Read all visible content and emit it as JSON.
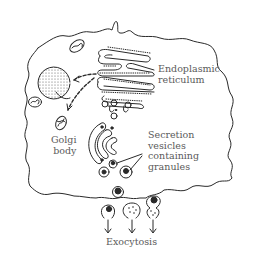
{
  "diagram": {
    "type": "cell secretion pathway illustration",
    "colors": {
      "ink": "#2a2a2a",
      "label": "#5a5a5a",
      "background": "#ffffff"
    },
    "labels": {
      "er_line1": "Endoplasmic",
      "er_line2": "reticulum",
      "golgi_line1": "Golgi",
      "golgi_line2": "body",
      "vesicles_line1": "Secretion",
      "vesicles_line2": "vesicles",
      "vesicles_line3": "containing",
      "vesicles_line4": "granules",
      "exocytosis": "Exocytosis"
    },
    "components": [
      {
        "name": "cell-membrane",
        "icon": "wavy-outline"
      },
      {
        "name": "nucleus",
        "icon": "stippled-circle"
      },
      {
        "name": "endoplasmic-reticulum",
        "icon": "stacked-cisternae"
      },
      {
        "name": "golgi-body",
        "icon": "curved-stack"
      },
      {
        "name": "mitochondria",
        "icon": "oval-cristae"
      },
      {
        "name": "secretion-vesicles",
        "icon": "circle-with-granule"
      },
      {
        "name": "exocytosis-arrows",
        "icon": "down-arrow"
      }
    ]
  }
}
